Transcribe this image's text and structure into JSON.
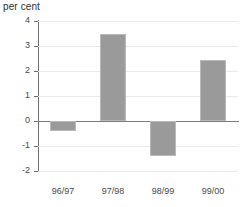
{
  "chart_data": {
    "type": "bar",
    "title": "per cent",
    "subtitle": "",
    "xlabel": "",
    "ylabel": "per cent",
    "categories": [
      "96/97",
      "97/98",
      "98/99",
      "99/00"
    ],
    "values": [
      -0.4,
      3.5,
      -1.4,
      2.45
    ],
    "ylim": [
      -2,
      4
    ],
    "ytick_values": [
      4,
      3,
      2,
      1,
      0,
      -1,
      -2
    ],
    "ytick_labels": [
      "4",
      "3",
      "2",
      "1",
      "0",
      "-1",
      "-2"
    ],
    "grid": true,
    "grid_axis": "y",
    "legend": false,
    "legend_position": "none",
    "series": [
      {
        "name": "per cent",
        "values": [
          -0.4,
          3.5,
          -1.4,
          2.45
        ],
        "color": "#9a9a9a"
      }
    ],
    "colors": {
      "bar_fill": "#9a9a9a",
      "bar_border": "#b9b9b9",
      "gridline": "#e9e9e9",
      "axis": "#6e6e6e",
      "zero_line": "#7d7d7d",
      "text": "#4a4a4a",
      "background": "#ffffff"
    }
  }
}
